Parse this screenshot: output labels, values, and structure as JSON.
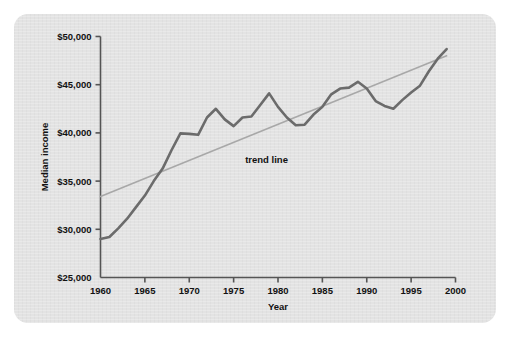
{
  "figure": {
    "card_bg": "#e3e3e3",
    "page_bg": "#ffffff"
  },
  "chart_data": {
    "type": "line",
    "title": "",
    "subtitle": "",
    "xlabel": "Year",
    "ylabel": "Median income",
    "xlim": [
      1960,
      2000
    ],
    "ylim": [
      25000,
      50000
    ],
    "grid": false,
    "legend_position": "none",
    "x_ticks": [
      1960,
      1965,
      1970,
      1975,
      1980,
      1985,
      1990,
      1995,
      2000
    ],
    "x_tick_labels": [
      "1960",
      "1965",
      "1970",
      "1975",
      "1980",
      "1985",
      "1990",
      "1995",
      "2000"
    ],
    "y_ticks": [
      25000,
      30000,
      35000,
      40000,
      45000,
      50000
    ],
    "y_tick_labels": [
      "$25,000",
      "$30,000",
      "$35,000",
      "$40,000",
      "$45,000",
      "$50,000"
    ],
    "annotations": [
      {
        "text": "trend line",
        "x": 1976.3,
        "y": 36900,
        "color": "#111111"
      }
    ],
    "series": [
      {
        "name": "Median income",
        "type": "line",
        "color": "#6b6b6b",
        "width": 2.6,
        "x": [
          1960,
          1961,
          1962,
          1963,
          1964,
          1965,
          1966,
          1967,
          1968,
          1969,
          1970,
          1971,
          1972,
          1973,
          1974,
          1975,
          1976,
          1977,
          1978,
          1979,
          1980,
          1981,
          1982,
          1983,
          1984,
          1985,
          1986,
          1987,
          1988,
          1989,
          1990,
          1991,
          1992,
          1993,
          1994,
          1995,
          1996,
          1997,
          1998,
          1999
        ],
        "values": [
          29000,
          29200,
          30100,
          31100,
          32300,
          33500,
          35000,
          36300,
          38200,
          39950,
          39900,
          39800,
          41600,
          42500,
          41400,
          40700,
          41600,
          41700,
          42900,
          44100,
          42700,
          41600,
          40800,
          40850,
          41900,
          42700,
          44000,
          44600,
          44700,
          45300,
          44600,
          43300,
          42800,
          42500,
          43400,
          44200,
          44900,
          46400,
          47700,
          48700
        ]
      },
      {
        "name": "trend line",
        "type": "line",
        "color": "#a8a8a8",
        "width": 1.6,
        "x": [
          1960,
          1999
        ],
        "values": [
          33400,
          48000
        ]
      }
    ]
  }
}
